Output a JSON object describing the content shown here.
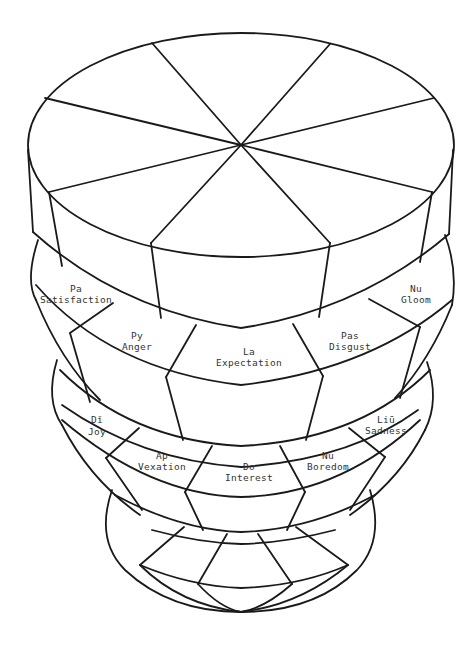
{
  "diagram": {
    "type": "stacked-layered-cake-wheel",
    "line_color": "#1a1a1a",
    "text_color": "#333333",
    "background": "#ffffff",
    "top_disk": {
      "segments": 8,
      "labels": []
    },
    "band_1": {
      "segments": [
        {
          "code": "Pa",
          "emotion": "Satisfaction"
        },
        {
          "code": "Py",
          "emotion": "Anger"
        },
        {
          "code": "La",
          "emotion": "Expectation"
        },
        {
          "code": "Pas",
          "emotion": "Disgust"
        },
        {
          "code": "Nu",
          "emotion": "Gloom"
        }
      ]
    },
    "band_2": {
      "segments": [
        {
          "code": "Dǐ",
          "emotion": "Joy"
        },
        {
          "code": "Ap",
          "emotion": "Vexation"
        },
        {
          "code": "Do",
          "emotion": "Interest"
        },
        {
          "code": "Nu",
          "emotion": "Boredom"
        },
        {
          "code": "Liū",
          "emotion": "Sadness"
        }
      ]
    },
    "base_bowl": {
      "segments": 6,
      "labels": []
    }
  }
}
